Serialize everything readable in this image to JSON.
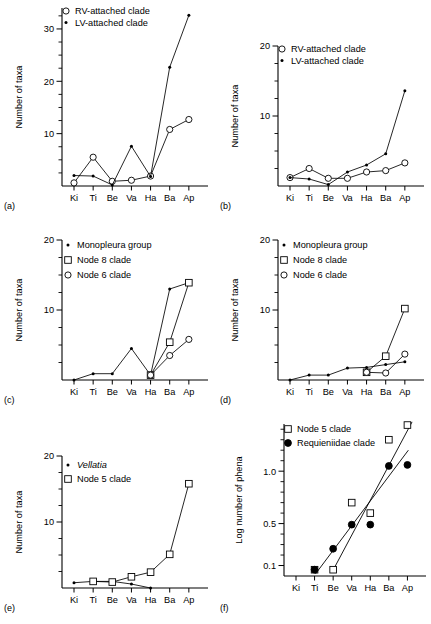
{
  "figure": {
    "panels": [
      "a",
      "b",
      "c",
      "d",
      "e",
      "f"
    ],
    "shared_xcategories": [
      "Ki",
      "Ti",
      "Be",
      "Va",
      "Ha",
      "Ba",
      "Ap"
    ],
    "ylabel_counts": "Number of taxa",
    "ylabel_log": "Log number of phena"
  },
  "labels": {
    "a": "(a)",
    "b": "(b)",
    "c": "(c)",
    "d": "(d)",
    "e": "(e)",
    "f": "(f)"
  },
  "chart_data": [
    {
      "id": "a",
      "type": "line",
      "title": "",
      "xlabel": "",
      "ylabel": "Number of taxa",
      "categories": [
        "Ki",
        "Ti",
        "Be",
        "Va",
        "Ha",
        "Ba",
        "Ap"
      ],
      "ylim": [
        0,
        34
      ],
      "yticks": [
        10,
        20,
        30
      ],
      "yticklabels": [
        "10",
        "20",
        "30"
      ],
      "yminor": [
        2.5,
        5,
        7.5,
        12.5,
        15,
        17.5,
        22.5,
        25,
        27.5,
        32.5
      ],
      "grid": false,
      "legend_position": "top-left",
      "series": [
        {
          "name": "RV-attached clade",
          "marker": "open-circle",
          "values": [
            0.6,
            5.5,
            0.9,
            1.1,
            1.9,
            10.8,
            12.7
          ]
        },
        {
          "name": "LV-attached clade",
          "marker": "star",
          "values": [
            2.0,
            1.9,
            0.2,
            7.6,
            1.8,
            22.7,
            32.6
          ]
        }
      ]
    },
    {
      "id": "b",
      "type": "line",
      "title": "",
      "xlabel": "",
      "ylabel": "Number of taxa",
      "categories": [
        "Ki",
        "Ti",
        "Be",
        "Va",
        "Ha",
        "Ba",
        "Ap"
      ],
      "ylim": [
        0,
        20
      ],
      "yticks": [
        10,
        20
      ],
      "yticklabels": [
        "10",
        "20"
      ],
      "yminor": [
        2.5,
        5,
        7.5,
        12.5,
        15,
        17.5
      ],
      "grid": false,
      "legend_position": "top-left",
      "series": [
        {
          "name": "RV-attached clade",
          "marker": "open-circle",
          "values": [
            1.2,
            2.5,
            1.1,
            1.1,
            2.0,
            2.2,
            3.3
          ]
        },
        {
          "name": "LV-attached clade",
          "marker": "star",
          "values": [
            1.2,
            1.0,
            0.2,
            2.0,
            3.0,
            4.6,
            13.6
          ]
        }
      ]
    },
    {
      "id": "c",
      "type": "line",
      "title": "",
      "xlabel": "",
      "ylabel": "Number of taxa",
      "categories": [
        "Ki",
        "Ti",
        "Be",
        "Va",
        "Ha",
        "Ba",
        "Ap"
      ],
      "ylim": [
        0,
        20
      ],
      "yticks": [
        10,
        20
      ],
      "yticklabels": [
        "10",
        "20"
      ],
      "yminor": [
        2.5,
        5,
        7.5,
        12.5,
        15,
        17.5
      ],
      "grid": false,
      "legend_position": "top-left",
      "series": [
        {
          "name": "Monopleura group",
          "marker": "star",
          "values": [
            0.0,
            0.9,
            0.9,
            4.5,
            0.7,
            13.0,
            13.9
          ]
        },
        {
          "name": "Node 8 clade",
          "marker": "open-square",
          "values": [
            null,
            null,
            null,
            null,
            0.7,
            5.4,
            13.9
          ]
        },
        {
          "name": "Node 6 clade",
          "marker": "open-circle",
          "values": [
            null,
            null,
            null,
            null,
            0.7,
            3.5,
            5.8
          ]
        }
      ]
    },
    {
      "id": "d",
      "type": "line",
      "title": "",
      "xlabel": "",
      "ylabel": "Number of taxa",
      "categories": [
        "Ki",
        "Ti",
        "Be",
        "Va",
        "Ha",
        "Ba",
        "Ap"
      ],
      "ylim": [
        0,
        20
      ],
      "yticks": [
        10,
        20
      ],
      "yticklabels": [
        "10",
        "20"
      ],
      "yminor": [
        2.5,
        5,
        7.5,
        12.5,
        15,
        17.5
      ],
      "grid": false,
      "legend_position": "top-left",
      "series": [
        {
          "name": "Monopleura group",
          "marker": "star",
          "values": [
            0.0,
            0.7,
            0.7,
            1.7,
            1.8,
            2.2,
            2.6
          ]
        },
        {
          "name": "Node 8 clade",
          "marker": "open-square",
          "values": [
            null,
            null,
            null,
            null,
            1.1,
            3.4,
            10.2
          ]
        },
        {
          "name": "Node 6 clade",
          "marker": "open-circle",
          "values": [
            null,
            null,
            null,
            null,
            1.1,
            1.0,
            3.7
          ]
        }
      ]
    },
    {
      "id": "e",
      "type": "line",
      "title": "",
      "xlabel": "",
      "ylabel": "Number of taxa",
      "categories": [
        "Ki",
        "Ti",
        "Be",
        "Va",
        "Ha",
        "Ba",
        "Ap"
      ],
      "ylim": [
        0,
        20
      ],
      "yticks": [
        10,
        20
      ],
      "yticklabels": [
        "10",
        "20"
      ],
      "yminor": [
        2.5,
        5,
        7.5,
        12.5,
        15,
        17.5
      ],
      "grid": false,
      "legend_position": "top-left",
      "series": [
        {
          "name": "Vellatia",
          "marker": "star",
          "italic": true,
          "values": [
            0.8,
            1.0,
            1.0,
            0.6,
            0.0,
            null,
            null
          ]
        },
        {
          "name": "Node 5 clade",
          "marker": "open-square",
          "values": [
            null,
            1.0,
            0.9,
            1.7,
            2.4,
            5.1,
            15.8
          ]
        }
      ]
    },
    {
      "id": "f",
      "type": "scatter",
      "title": "",
      "xlabel": "",
      "ylabel": "Log number of phena",
      "categories": [
        "Ki",
        "Ti",
        "Be",
        "Va",
        "Ha",
        "Ba",
        "Ap"
      ],
      "ylim": [
        0.0,
        1.45
      ],
      "yticks": [
        0.1,
        0.5,
        1.0
      ],
      "yticklabels": [
        "0.1",
        "0.5",
        "1.0"
      ],
      "yminor": [
        0.2,
        0.3,
        0.4,
        0.6,
        0.7,
        0.8,
        0.9,
        1.1,
        1.2,
        1.3,
        1.4
      ],
      "grid": false,
      "legend_position": "top-left",
      "series": [
        {
          "name": "Node 5 clade",
          "marker": "open-square",
          "values": [
            null,
            0.06,
            0.06,
            0.7,
            0.6,
            1.3,
            1.44
          ]
        },
        {
          "name": "Requieniidae clade",
          "marker": "filled-circle",
          "values": [
            null,
            0.06,
            0.26,
            0.49,
            0.49,
            1.05,
            1.06
          ]
        }
      ],
      "fit_lines": [
        {
          "name": "Node 5 clade fit",
          "x0_cat": 1.92,
          "y0": 0.03,
          "x1_cat": 6.25,
          "y1": 1.47
        },
        {
          "name": "Requieniidae clade fit",
          "x0_cat": 1.05,
          "y0": 0.02,
          "x1_cat": 6.05,
          "y1": 1.2
        }
      ]
    }
  ]
}
